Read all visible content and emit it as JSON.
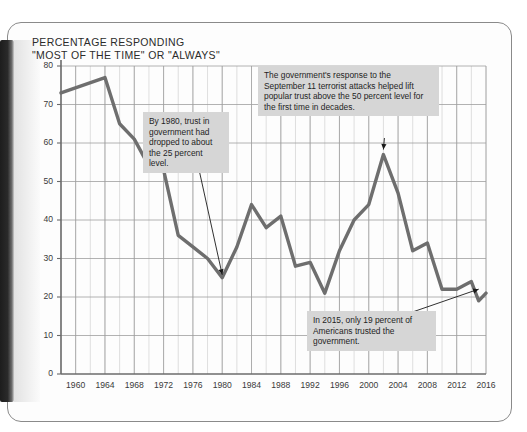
{
  "page": {
    "title_line1": "PERCENTAGE RESPONDING",
    "title_line2": "\"MOST OF THE TIME\" OR \"ALWAYS\""
  },
  "annotations": [
    {
      "id": "annot-1980",
      "text": "By 1980, trust in government had dropped to about the 25 percent level.",
      "points_to_year": 1980,
      "points_to_value": 25
    },
    {
      "id": "annot-911",
      "text": "The government's response to the September 11 terrorist attacks helped lift popular trust above the 50 percent level for the first time in decades.",
      "points_to_year": 2002,
      "points_to_value": 57
    },
    {
      "id": "annot-2015",
      "text": "In 2015, only 19 percent of Americans trusted the government.",
      "points_to_year": 2015,
      "points_to_value": 21
    }
  ],
  "chart_data": {
    "type": "line",
    "xlabel": "",
    "ylabel": "",
    "xlim": [
      1958,
      2016
    ],
    "ylim": [
      0,
      80
    ],
    "ytick_step": 10,
    "yticks": [
      0,
      10,
      20,
      30,
      40,
      50,
      60,
      70,
      80
    ],
    "xticks": [
      1960,
      1964,
      1968,
      1972,
      1976,
      1980,
      1984,
      1988,
      1992,
      1996,
      2000,
      2004,
      2008,
      2012,
      2016
    ],
    "xgrid_step": 2,
    "grid": true,
    "legend": "none",
    "line_color": "#6e6e6e",
    "line_width": 3.4,
    "series": [
      {
        "name": "Trust in government",
        "x": [
          1958,
          1964,
          1966,
          1968,
          1970,
          1972,
          1974,
          1976,
          1978,
          1980,
          1982,
          1984,
          1986,
          1988,
          1990,
          1992,
          1994,
          1996,
          1998,
          2000,
          2002,
          2004,
          2006,
          2008,
          2010,
          2012,
          2014,
          2015,
          2016
        ],
        "values": [
          73,
          77,
          65,
          61,
          54,
          53,
          36,
          33,
          30,
          25,
          33,
          44,
          38,
          41,
          28,
          29,
          21,
          32,
          40,
          44,
          57,
          47,
          32,
          34,
          22,
          22,
          24,
          19,
          21
        ]
      }
    ]
  }
}
